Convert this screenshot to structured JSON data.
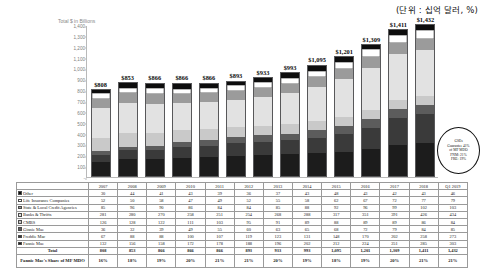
{
  "unit_note": "(단위 : 십억 달러, %)",
  "chart_axis_title": "Total $ in Billions",
  "callout": {
    "line1": "GSEs",
    "line2": "Guarantee 41%",
    "line3": "of MF MDO",
    "line4": "FNM: 21%",
    "line5": "FRE: 19%"
  },
  "legend_colors": {
    "other": "#0d0d0d",
    "life_insurance": "#ffffff",
    "state_local": "#9b9b9b",
    "banks_thrifts": "#e2e2e2",
    "cmbs": "#c9c9c9",
    "ginnie_mae": "#5c5c5c",
    "freddie_mac": "#3a3a3a",
    "fannie_mae": "#1c1c1c"
  },
  "chart_data": {
    "type": "bar",
    "subtype": "stacked",
    "title": "",
    "ylabel": "Total $ in Billions",
    "xlabel": "",
    "ylim": [
      0,
      1400
    ],
    "yticks": [
      0,
      100,
      200,
      300,
      400,
      500,
      600,
      700,
      800,
      900,
      1000,
      1100,
      1200,
      1300,
      1400
    ],
    "ytick_labels": [
      "-",
      "100",
      "200",
      "300",
      "400",
      "500",
      "600",
      "700",
      "800",
      "900",
      "1,000",
      "1,100",
      "1,200",
      "1,300",
      "1,400"
    ],
    "grid": false,
    "legend_position": "table",
    "categories": [
      "2007",
      "2008",
      "2009",
      "2010",
      "2011",
      "2012",
      "2013",
      "2014",
      "2015",
      "2016",
      "2017",
      "2018",
      "Q1 2019"
    ],
    "total_labels": [
      "$808",
      "$853",
      "$866",
      "$866",
      "$866",
      "$893",
      "$933",
      "$993",
      "$1,095",
      "$1,201",
      "$1,309",
      "$1,411",
      "$1,432"
    ],
    "series": [
      {
        "name": "Fannie Mae",
        "values": [
          132,
          156,
          158,
          172,
          178,
          188,
          196,
          202,
          212,
          224,
          251,
          285,
          303
        ]
      },
      {
        "name": "Freddie Mac",
        "values": [
          67,
          88,
          88,
          100,
          107,
          119,
          123,
          131,
          148,
          170,
          202,
          258,
          273
        ]
      },
      {
        "name": "Ginnie Mae",
        "values": [
          36,
          32,
          39,
          49,
          55,
          60,
          63,
          65,
          68,
          72,
          79,
          84,
          85
        ]
      },
      {
        "name": "CMBS",
        "values": [
          126,
          128,
          122,
          111,
          103,
          95,
          91,
          89,
          88,
          89,
          89,
          86,
          84
        ]
      },
      {
        "name": "Banks & Thrifts",
        "values": [
          281,
          280,
          270,
          258,
          251,
          254,
          268,
          288,
          317,
          351,
          391,
          426,
          434
        ]
      },
      {
        "name": "State & Local Credit Agencies",
        "values": [
          85,
          96,
          90,
          86,
          84,
          84,
          85,
          88,
          92,
          96,
          99,
          102,
          103
        ]
      },
      {
        "name": "Life Insurance Companies",
        "values": [
          52,
          50,
          58,
          47,
          49,
          52,
          55,
          58,
          62,
          67,
          72,
          77,
          79
        ]
      },
      {
        "name": "Other",
        "values": [
          30,
          44,
          41,
          43,
          39,
          36,
          37,
          43,
          48,
          43,
          42,
          43,
          46
        ]
      }
    ]
  },
  "table": {
    "row_label_header": "",
    "year_headers": [
      "2007",
      "2008",
      "2009",
      "2010",
      "2011",
      "2012",
      "2013",
      "2014",
      "2015",
      "2016",
      "2017",
      "2018",
      "Q1 2019"
    ],
    "rows": [
      {
        "label": "Other",
        "swatch": "#0d0d0d",
        "values": [
          "30",
          "44",
          "41",
          "43",
          "39",
          "36",
          "37",
          "43",
          "48",
          "43",
          "42",
          "43",
          "46"
        ]
      },
      {
        "label": "Life Insurance Companies",
        "swatch": "#ffffff",
        "values": [
          "52",
          "50",
          "58",
          "47",
          "49",
          "52",
          "55",
          "58",
          "62",
          "67",
          "72",
          "77",
          "79"
        ]
      },
      {
        "label": "State & Local Credit Agencies",
        "swatch": "#9b9b9b",
        "values": [
          "85",
          "96",
          "90",
          "86",
          "84",
          "84",
          "85",
          "88",
          "92",
          "96",
          "99",
          "102",
          "103"
        ]
      },
      {
        "label": "Banks & Thrifts",
        "swatch": "#e2e2e2",
        "values": [
          "281",
          "280",
          "270",
          "258",
          "251",
          "254",
          "268",
          "288",
          "317",
          "351",
          "391",
          "426",
          "434"
        ]
      },
      {
        "label": "CMBS",
        "swatch": "#c9c9c9",
        "values": [
          "126",
          "128",
          "122",
          "111",
          "103",
          "95",
          "91",
          "89",
          "88",
          "89",
          "89",
          "86",
          "84"
        ]
      },
      {
        "label": "Ginnie Mae",
        "swatch": "#5c5c5c",
        "values": [
          "36",
          "32",
          "39",
          "49",
          "55",
          "60",
          "63",
          "65",
          "68",
          "72",
          "79",
          "84",
          "85"
        ]
      },
      {
        "label": "Freddie Mac",
        "swatch": "#3a3a3a",
        "values": [
          "67",
          "88",
          "88",
          "100",
          "107",
          "119",
          "123",
          "131",
          "148",
          "170",
          "202",
          "258",
          "273"
        ]
      },
      {
        "label": "Fannie Mae",
        "swatch": "#1c1c1c",
        "values": [
          "132",
          "156",
          "158",
          "172",
          "178",
          "188",
          "196",
          "202",
          "212",
          "224",
          "251",
          "285",
          "303"
        ]
      }
    ],
    "total_row": {
      "label": "Total",
      "values": [
        "808",
        "853",
        "866",
        "866",
        "866",
        "893",
        "933",
        "993",
        "1,095",
        "1,201",
        "1,309",
        "1,411",
        "1,432"
      ]
    },
    "share_row": {
      "label": "Fannie Mae's Share of MF MDO",
      "values": [
        "16%",
        "18%",
        "19%",
        "20%",
        "21%",
        "21%",
        "20%",
        "19%",
        "18%",
        "19%",
        "20%",
        "21%",
        "21%"
      ]
    }
  }
}
